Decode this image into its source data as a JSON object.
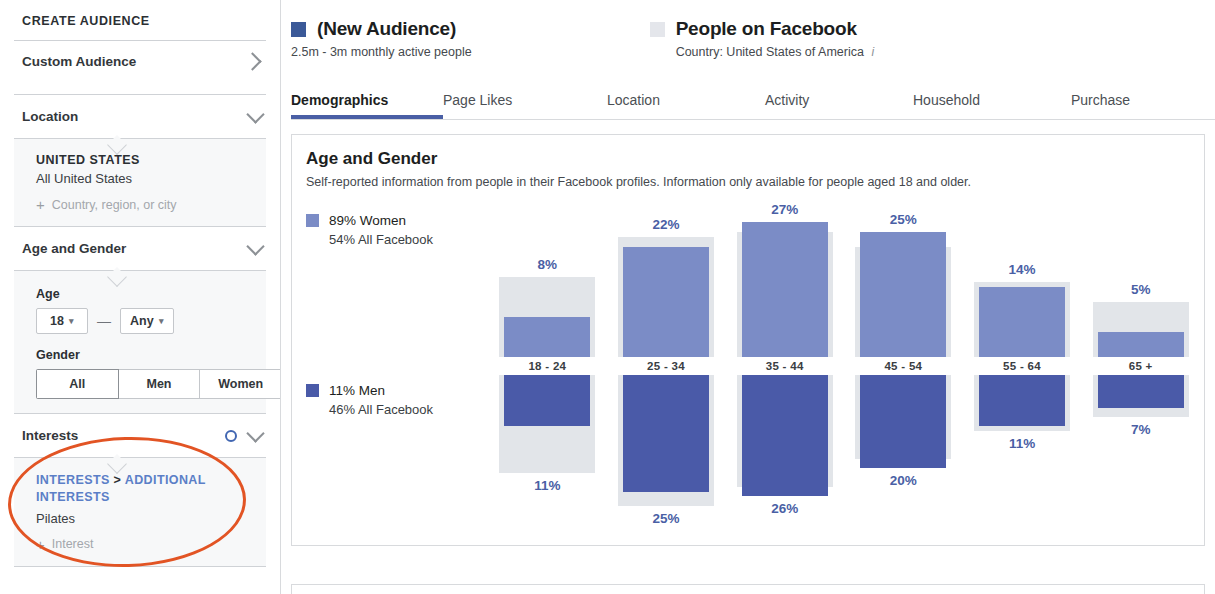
{
  "sidebar": {
    "title": "CREATE AUDIENCE",
    "custom_audience": {
      "label": "Custom Audience",
      "chevron": "chevron-right-icon"
    },
    "location": {
      "label": "Location",
      "chevron": "chevron-down-icon"
    },
    "location_panel": {
      "country_heading": "UNITED STATES",
      "country_value": "All United States",
      "add_placeholder": "Country, region, or city",
      "plus": "+"
    },
    "age_gender": {
      "label": "Age and Gender",
      "chevron": "chevron-down-icon"
    },
    "age_panel": {
      "age_label": "Age",
      "age_min": "18",
      "age_max": "Any",
      "dash": "—",
      "gender_label": "Gender",
      "gender_options": [
        "All",
        "Men",
        "Women"
      ],
      "gender_selected": "All"
    },
    "interests": {
      "label": "Interests",
      "chevron": "chevron-down-icon",
      "dot": "target-dot-icon"
    },
    "interests_panel": {
      "breadcrumb_first": "INTERESTS",
      "breadcrumb_sep": " > ",
      "breadcrumb_second": "ADDITIONAL INTERESTS",
      "value": "Pilates",
      "add_placeholder": "Interest",
      "plus": "+"
    },
    "annotation_color": "#e25424"
  },
  "header": {
    "audience": {
      "name": "(New Audience)",
      "subtitle": "2.5m - 3m monthly active people",
      "swatch_color": "#3b5998"
    },
    "comparison": {
      "name": "People on Facebook",
      "subtitle": "Country: United States of America",
      "info_icon": "i",
      "swatch_color": "#e4e6eb"
    }
  },
  "tabs": {
    "items": [
      {
        "label": "Demographics",
        "active": true
      },
      {
        "label": "Page Likes",
        "active": false
      },
      {
        "label": "Location",
        "active": false
      },
      {
        "label": "Activity",
        "active": false
      },
      {
        "label": "Household",
        "active": false
      },
      {
        "label": "Purchase",
        "active": false
      }
    ],
    "accent_color": "#4a5fa5"
  },
  "card": {
    "title": "Age and Gender",
    "subtitle": "Self-reported information from people in their Facebook profiles. Information only available for people aged 18 and older.",
    "legend": {
      "women": {
        "pct": "89% Women",
        "benchmark": "54% All Facebook",
        "color": "#7b8cc6"
      },
      "men": {
        "pct": "11% Men",
        "benchmark": "46% All Facebook",
        "color": "#4a5aa8"
      }
    }
  },
  "chart_data": {
    "type": "bar",
    "title": "Age and Gender",
    "xlabel": "",
    "ylabel": "",
    "ylim": [
      0,
      30
    ],
    "grid": false,
    "legend_position": "left",
    "categories": [
      "18 - 24",
      "25 - 34",
      "35 - 44",
      "45 - 54",
      "55 - 64",
      "65 +"
    ],
    "series": [
      {
        "name": "Women",
        "color": "#7b8cc6",
        "direction": "up",
        "values": [
          8,
          22,
          27,
          25,
          14,
          5
        ],
        "labels": [
          "8%",
          "22%",
          "27%",
          "25%",
          "14%",
          "5%"
        ]
      },
      {
        "name": "Men",
        "color": "#4a5aa8",
        "direction": "down",
        "values": [
          11,
          25,
          26,
          20,
          11,
          7
        ],
        "labels": [
          "11%",
          "25%",
          "26%",
          "20%",
          "11%",
          "7%"
        ]
      },
      {
        "name": "All Facebook (benchmark) Women",
        "color": "#e2e5e9",
        "direction": "up",
        "values": [
          16,
          24,
          25,
          22,
          15,
          11
        ]
      },
      {
        "name": "All Facebook (benchmark) Men",
        "color": "#e2e5e9",
        "direction": "down",
        "values": [
          21,
          28,
          24,
          18,
          12,
          9
        ]
      }
    ]
  }
}
